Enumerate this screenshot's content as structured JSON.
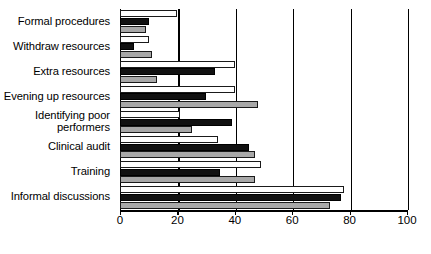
{
  "chart_data": {
    "type": "bar",
    "orientation": "horizontal",
    "title": "",
    "subtitle": "",
    "xlabel": "",
    "ylabel": "",
    "xlim": [
      0,
      100
    ],
    "xticks": [
      0,
      20,
      40,
      60,
      80,
      100
    ],
    "xtick_labels": [
      "0",
      "20",
      "40",
      "60",
      "80",
      "100"
    ],
    "grid": true,
    "grid_axis": "x",
    "legend": null,
    "legend_position": "none",
    "categories": [
      "Formal procedures",
      "Withdraw resources",
      "Extra resources",
      "Evening up resources",
      "Identifying poor performers",
      "Clinical audit",
      "Training",
      "Informal discussions"
    ],
    "series": [
      {
        "name": "series-1",
        "style": "white",
        "color": "#ffffff",
        "values": [
          20,
          10,
          40,
          40,
          21,
          34,
          49,
          78
        ]
      },
      {
        "name": "series-2",
        "style": "black",
        "color": "#111111",
        "values": [
          10,
          5,
          33,
          30,
          39,
          45,
          35,
          77
        ]
      },
      {
        "name": "series-3",
        "style": "gray",
        "color": "#a8a8a8",
        "values": [
          9,
          11,
          13,
          48,
          25,
          47,
          47,
          73
        ]
      }
    ]
  },
  "axis": {
    "tick_labels": [
      "0",
      "20",
      "40",
      "60",
      "80",
      "100"
    ]
  },
  "labels": {
    "items": [
      {
        "line1": "Formal procedures",
        "line2": ""
      },
      {
        "line1": "Withdraw resources",
        "line2": ""
      },
      {
        "line1": "Extra resources",
        "line2": ""
      },
      {
        "line1": "Evening up resources",
        "line2": ""
      },
      {
        "line1": "Identifying poor",
        "line2": "performers"
      },
      {
        "line1": "Clinical audit",
        "line2": ""
      },
      {
        "line1": "Training",
        "line2": ""
      },
      {
        "line1": "Informal discussions",
        "line2": ""
      }
    ]
  }
}
